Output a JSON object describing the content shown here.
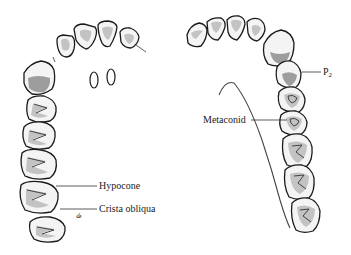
{
  "figure": {
    "background": "#ffffff",
    "line_color": "#1a1a1a",
    "left_arch": {
      "name": "upper-arch",
      "labels": [
        {
          "id": "hypocone",
          "text": "Hypocone",
          "x": 99,
          "y": 181
        },
        {
          "id": "crista-obliqua",
          "text": "Crista obliqua",
          "x": 99,
          "y": 205
        }
      ],
      "small_mark": {
        "text": "ሬ",
        "x": 76,
        "y": 212
      },
      "incisive_foramina": 2
    },
    "right_arch": {
      "name": "lower-arch",
      "labels": [
        {
          "id": "p2",
          "text": "P",
          "subscript": "2",
          "x": 323,
          "y": 68
        },
        {
          "id": "metaconid",
          "text": "Metaconid",
          "x": 203,
          "y": 117
        }
      ]
    }
  }
}
